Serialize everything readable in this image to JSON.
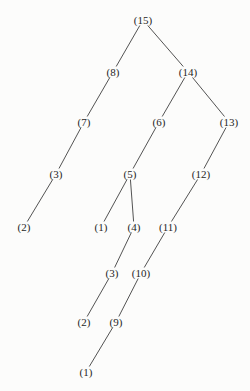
{
  "page": {
    "background": "#fcfcfb",
    "text_color": "#262626",
    "line_color": "#3f3f3f"
  },
  "diagram": {
    "type": "tree",
    "nodes": [
      {
        "id": "n15",
        "label": "(15)",
        "x": 143,
        "y": 20
      },
      {
        "id": "n8",
        "label": "(8)",
        "x": 113,
        "y": 72
      },
      {
        "id": "n14",
        "label": "(14)",
        "x": 188,
        "y": 72
      },
      {
        "id": "n7",
        "label": "(7)",
        "x": 84,
        "y": 122
      },
      {
        "id": "n6",
        "label": "(6)",
        "x": 159,
        "y": 122
      },
      {
        "id": "n13",
        "label": "(13)",
        "x": 229,
        "y": 122
      },
      {
        "id": "n3a",
        "label": "(3)",
        "x": 56,
        "y": 174
      },
      {
        "id": "n5",
        "label": "(5)",
        "x": 130,
        "y": 174
      },
      {
        "id": "n12",
        "label": "(12)",
        "x": 201,
        "y": 174
      },
      {
        "id": "n2a",
        "label": "(2)",
        "x": 24,
        "y": 227
      },
      {
        "id": "n1a",
        "label": "(1)",
        "x": 101,
        "y": 227
      },
      {
        "id": "n4",
        "label": "(4)",
        "x": 134,
        "y": 227
      },
      {
        "id": "n11",
        "label": "(11)",
        "x": 168,
        "y": 227
      },
      {
        "id": "n3b",
        "label": "(3)",
        "x": 112,
        "y": 273
      },
      {
        "id": "n10",
        "label": "(10)",
        "x": 141,
        "y": 273
      },
      {
        "id": "n2b",
        "label": "(2)",
        "x": 84,
        "y": 322
      },
      {
        "id": "n9",
        "label": "(9)",
        "x": 116,
        "y": 322
      },
      {
        "id": "n1b",
        "label": "(1)",
        "x": 86,
        "y": 372
      }
    ],
    "edges": [
      [
        "n15",
        "n8"
      ],
      [
        "n15",
        "n14"
      ],
      [
        "n8",
        "n7"
      ],
      [
        "n14",
        "n6"
      ],
      [
        "n14",
        "n13"
      ],
      [
        "n7",
        "n3a"
      ],
      [
        "n6",
        "n5"
      ],
      [
        "n13",
        "n12"
      ],
      [
        "n3a",
        "n2a"
      ],
      [
        "n5",
        "n1a"
      ],
      [
        "n5",
        "n4"
      ],
      [
        "n12",
        "n11"
      ],
      [
        "n4",
        "n3b"
      ],
      [
        "n11",
        "n10"
      ],
      [
        "n3b",
        "n2b"
      ],
      [
        "n10",
        "n9"
      ],
      [
        "n9",
        "n1b"
      ]
    ]
  }
}
